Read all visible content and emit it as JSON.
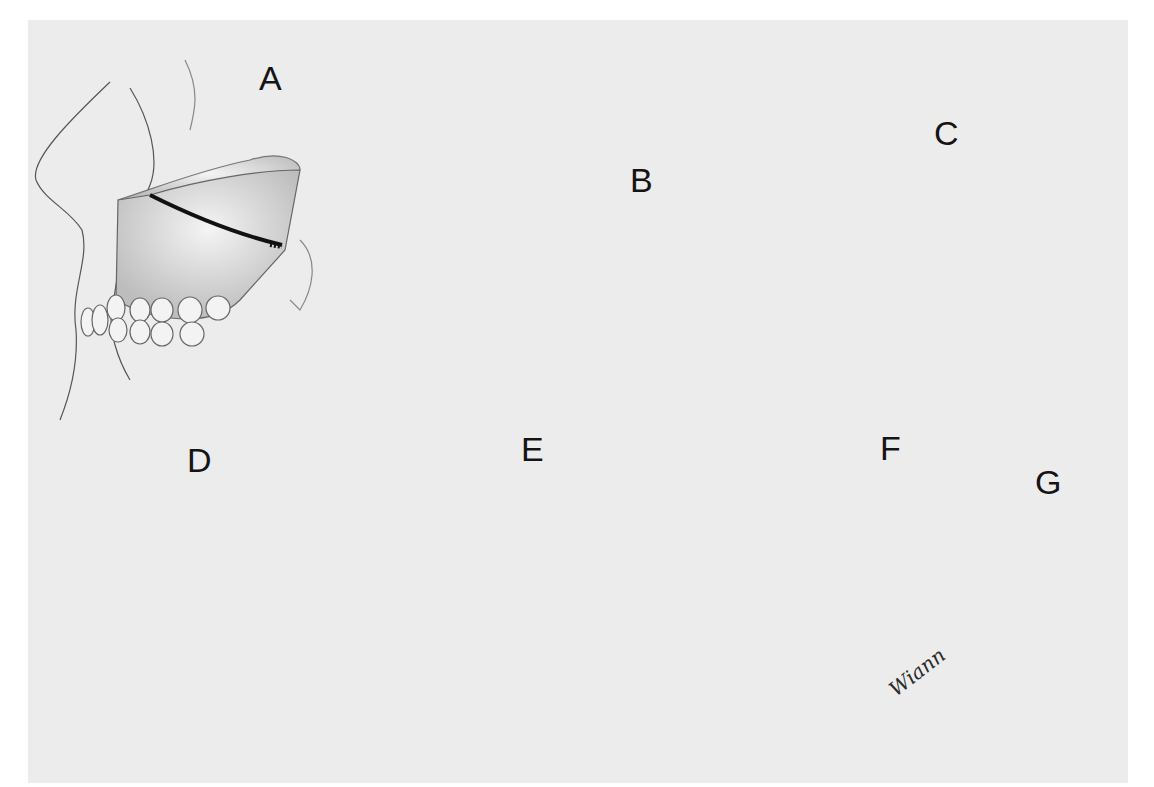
{
  "figure": {
    "background_color": "#ececec",
    "ink_color": "#141414",
    "panels": [
      {
        "label": "A",
        "content": "Lateral skull view with osteotomy line drawn across maxilla above teeth"
      },
      {
        "label": "B",
        "content": "Vestibular incision with retractors and drill; dashed osteotomy line"
      },
      {
        "label": "C",
        "content": "Frontal view of retracted maxilla with drill at nasal septum; dark nasal openings"
      },
      {
        "label": "D",
        "content": "Osteotome and chisel separating nasal septum from maxilla"
      },
      {
        "label": "E",
        "content": "Curved osteotome at pterygomaxillary junction, finger supporting teeth"
      },
      {
        "label": "F",
        "content": "Down-fractured maxilla with instrument and finger pressure"
      },
      {
        "label": "G",
        "content": "Lateral skull view with fixation wires across osteotomy"
      }
    ],
    "signature": "Wiann"
  }
}
